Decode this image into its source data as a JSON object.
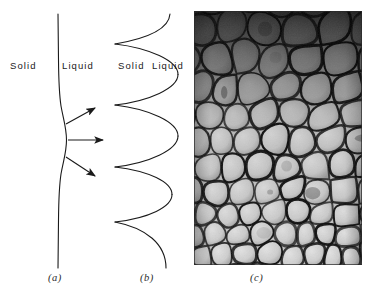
{
  "figure": {
    "background_color": "#ffffff",
    "line_color": "#1a1a1a"
  },
  "panels": [
    {
      "id": "a",
      "caption": "(a)",
      "caption_x": 48,
      "caption_y": 277,
      "description": "Planar solid-liquid interface with a local perturbation and three diverging solute-rejection arrows",
      "labels": [
        {
          "text": "Solid",
          "x": 10,
          "y": 66
        },
        {
          "text": "Liquid",
          "x": 62,
          "y": 66
        }
      ],
      "interface_path": "M 58 14 L 58.5 60 C 58.7 82 59.5 96 61 106 C 63.5 120 66.5 128 66.5 140 C 66.5 152 63.5 160 61 174 C 59.5 184 58.7 198 58.5 220 L 58 268",
      "arrows": [
        {
          "name": "arrow-upper",
          "x1": 66,
          "y1": 124,
          "x2": 95,
          "y2": 108
        },
        {
          "name": "arrow-middle",
          "x1": 68,
          "y1": 140,
          "x2": 103,
          "y2": 140
        },
        {
          "name": "arrow-lower",
          "x1": 66,
          "y1": 157,
          "x2": 95,
          "y2": 176
        }
      ]
    },
    {
      "id": "b",
      "caption": "(b)",
      "caption_x": 140,
      "caption_y": 277,
      "description": "Fully developed cellular interface: rounded cell caps bulging into the liquid separated by sharp cusps",
      "labels": [
        {
          "text": "Solid",
          "x": 118,
          "y": 66
        },
        {
          "text": "Liquid",
          "x": 152,
          "y": 66
        }
      ],
      "cusp_x": 115,
      "cusp_y_values": [
        44,
        105,
        167,
        222
      ],
      "cell_apex_x": 178,
      "interface_path": "M 170 14 C 168 26 150 38 115 44 C 150 50 178 70 178 105 C 178 70 150 50 115 44 M 115 105 C 150 111 178 135 178 167 C 178 135 150 111 115 105 M 115 167 C 148 173 172 192 172 222 C 172 192 148 173 115 167 M 115 222 C 146 228 166 244 166 268",
      "cell_arcs": [
        {
          "top_cusp": 44,
          "bottom_cusp": 105,
          "apex_x": 178
        },
        {
          "top_cusp": 105,
          "bottom_cusp": 167,
          "apex_x": 178
        },
        {
          "top_cusp": 167,
          "bottom_cusp": 222,
          "apex_x": 172
        }
      ]
    },
    {
      "id": "c",
      "caption": "(c)",
      "caption_x": 250,
      "caption_y": 277,
      "description": "Photomicrograph of a transverse section through a cellular solidification front showing polygonal cells with dark intercellular boundaries",
      "labels": [],
      "photo": {
        "x": 194,
        "y": 11,
        "width": 168,
        "height": 254,
        "base_tone": "#cfcfcf",
        "boundary_color": "#141414",
        "dark_region": "top",
        "cell_count_estimate": 60
      }
    }
  ],
  "style": {
    "stroke_width": 1.1,
    "label_font_size": "9.5px",
    "caption_font_size": "10.5px"
  }
}
